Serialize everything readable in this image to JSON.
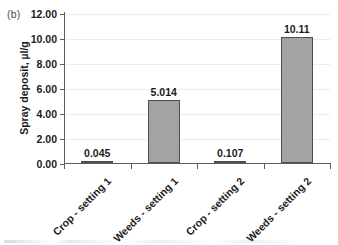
{
  "figure": {
    "panel_label": "(b)"
  },
  "chart_data": {
    "type": "bar",
    "title": "",
    "xlabel": "",
    "ylabel": "Spray deposit, µl/g",
    "categories": [
      "Crop - setting 1",
      "Weeds - setting 1",
      "Crop - setting 2",
      "Weeds - setting 2"
    ],
    "values": [
      0.045,
      5.014,
      0.107,
      10.11
    ],
    "value_labels": [
      "0.045",
      "5.014",
      "0.107",
      "10.11"
    ],
    "ylim": [
      0,
      12
    ],
    "ytick_values": [
      0,
      2,
      4,
      6,
      8,
      10,
      12
    ],
    "ytick_labels": [
      "0.00",
      "2.00",
      "4.00",
      "6.00",
      "8.00",
      "10.00",
      "12.00"
    ],
    "grid": "horizontal",
    "legend": "none",
    "bar_color": "#a3a3a3",
    "bar_edge_color": "#4d4d4d",
    "gridline_color": "#ececec",
    "axis_color": "#5d5d5d",
    "text_color": "#1b1b1b"
  }
}
